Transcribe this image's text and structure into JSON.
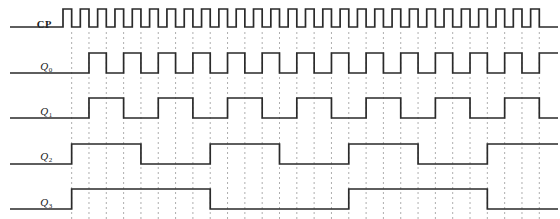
{
  "diagram": {
    "type": "digital-timing-waveform",
    "signals": [
      {
        "id": "CP",
        "name": "CP",
        "subscript": "",
        "divider": 1
      },
      {
        "id": "Q0",
        "name": "Q",
        "subscript": "0",
        "divider": 2
      },
      {
        "id": "Q1",
        "name": "Q",
        "subscript": "1",
        "divider": 4
      },
      {
        "id": "Q2",
        "name": "Q",
        "subscript": "2",
        "divider": 8
      },
      {
        "id": "Q3",
        "name": "Q",
        "subscript": "3",
        "divider": 16
      }
    ],
    "geometry": {
      "width": 560,
      "height": 219,
      "wave_start_x": 63,
      "wave_end_x": 548,
      "clock_period_px": 17.32,
      "clock_pulse_count": 28,
      "row_baselines": [
        27,
        73,
        118,
        164,
        209
      ],
      "row_amplitude": [
        18,
        20,
        20,
        20,
        20
      ],
      "label_x": 8,
      "label_y": [
        19,
        60,
        105,
        150,
        196
      ],
      "guide_top": 32,
      "guide_bottom": 219
    },
    "style": {
      "wave_color": "#2a2a2a",
      "wave_width": 1.7,
      "guide_color": "#999999",
      "guide_width": 0.8,
      "guide_dash": "2,3",
      "background": "#ffffff",
      "label_color": "#1a1a1a"
    },
    "chart_data": {
      "type": "line",
      "title": "Ripple counter waveforms",
      "x": "clock cycle index 0..28",
      "series": [
        {
          "name": "CP",
          "description": "square clock, 28 pulses, 50% duty"
        },
        {
          "name": "Q0",
          "description": "toggles each clock falling edge, period = 2 CP"
        },
        {
          "name": "Q1",
          "description": "toggles each Q0 falling edge, period = 4 CP"
        },
        {
          "name": "Q2",
          "description": "toggles each Q1 falling edge, period = 8 CP"
        },
        {
          "name": "Q3",
          "description": "toggles each Q2 falling edge, period = 16 CP"
        }
      ]
    }
  }
}
